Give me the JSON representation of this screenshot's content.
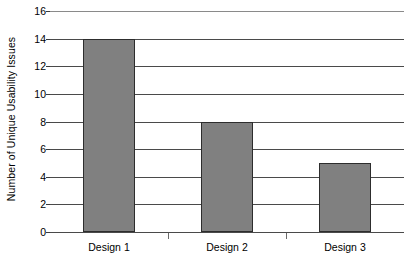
{
  "chart_data": {
    "type": "bar",
    "title": "",
    "xlabel": "",
    "ylabel": "Number of Unique Usability Issues",
    "categories": [
      "Design 1",
      "Design 2",
      "Design 3"
    ],
    "values": [
      14,
      8,
      5
    ],
    "ylim": [
      0,
      16
    ],
    "y_ticks": [
      0,
      2,
      4,
      6,
      8,
      10,
      12,
      14,
      16
    ],
    "y_tick_labels": [
      "0",
      "2",
      "4",
      "6",
      "8",
      "10",
      "12",
      "14",
      "16"
    ],
    "grid": true,
    "legend": "none",
    "bar_color": "#808080",
    "bar_edge_color": "#2d2d2d",
    "background_color": "#ffffff",
    "gridline_color": "#4a4a4a",
    "axis_color": "#3a3a3a"
  }
}
